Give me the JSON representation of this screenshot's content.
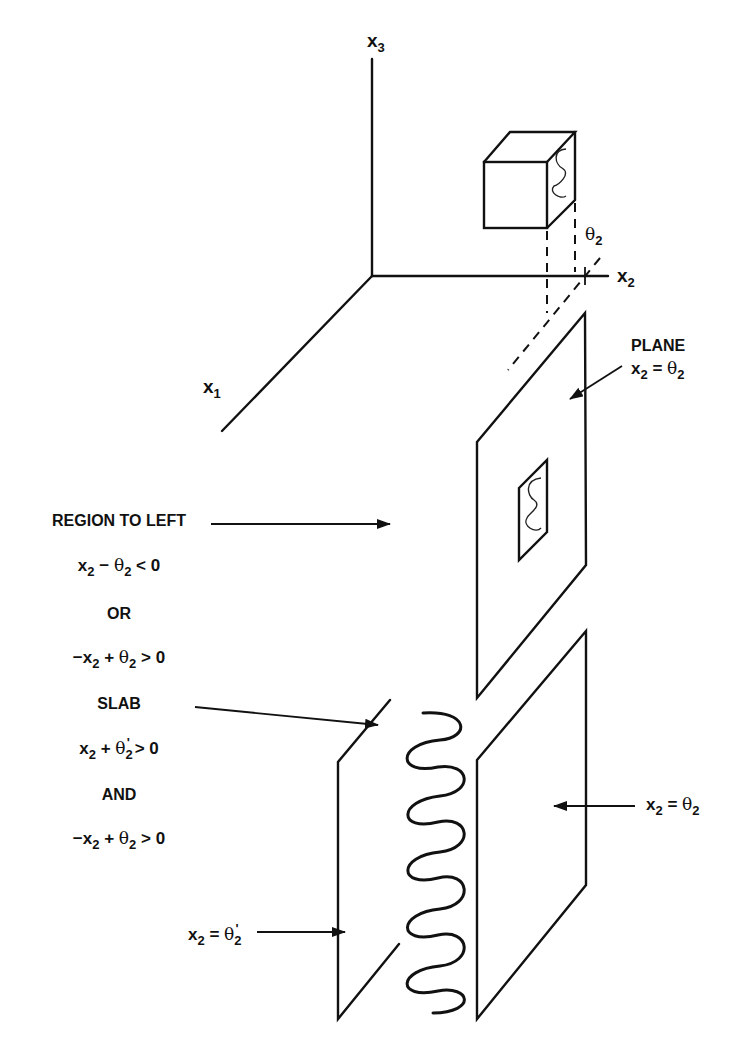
{
  "diagram": {
    "axes": {
      "x1": {
        "base": "x",
        "sub": "1"
      },
      "x2": {
        "base": "x",
        "sub": "2"
      },
      "x3": {
        "base": "x",
        "sub": "3"
      }
    },
    "theta_tick_label": {
      "base": "θ",
      "sub": "2"
    },
    "plane_label": {
      "title": "PLANE",
      "eq_lhs": "x",
      "eq_lhs_sub": "2",
      "eq_op": " = ",
      "eq_rhs": "θ",
      "eq_rhs_sub": "2"
    },
    "left_text": {
      "region_title": "REGION TO LEFT",
      "ineq1": {
        "a": "x",
        "a_sub": "2",
        "op": " − ",
        "b": "θ",
        "b_sub": "2",
        "rel": " < 0"
      },
      "or": "OR",
      "ineq2": {
        "pre": "−x",
        "a_sub": "2",
        "op": " + ",
        "b": "θ",
        "b_sub": "2",
        "rel": " > 0"
      },
      "slab_title": "SLAB",
      "ineq3": {
        "a": "x",
        "a_sub": "2",
        "op": " + ",
        "b": "θ",
        "b_sub": "2",
        "prime": "'",
        "rel": " > 0"
      },
      "and": "AND",
      "ineq4": {
        "pre": "−x",
        "a_sub": "2",
        "op": " + ",
        "b": "θ",
        "b_sub": "2",
        "rel": " > 0"
      }
    },
    "lower_left_label": {
      "lhs": "x",
      "lhs_sub": "2",
      "op": " = ",
      "rhs": "θ",
      "rhs_sub": "2",
      "prime": "'"
    },
    "lower_right_label": {
      "lhs": "x",
      "lhs_sub": "2",
      "op": " = ",
      "rhs": "θ",
      "rhs_sub": "2"
    },
    "colors": {
      "ink": "#111111",
      "background": "#ffffff"
    }
  }
}
